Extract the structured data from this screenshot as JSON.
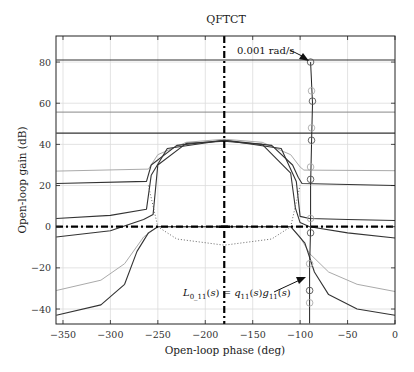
{
  "chart_data": {
    "type": "line",
    "title": "QFTCT",
    "xlabel": "Open-loop phase (deg)",
    "ylabel": "Open-loop gain (dB)",
    "xlim": [
      -357,
      0
    ],
    "ylim": [
      -47,
      93
    ],
    "xticks": [
      -350,
      -300,
      -250,
      -200,
      -150,
      -100,
      -50,
      0
    ],
    "yticks": [
      -40,
      -20,
      0,
      20,
      40,
      60,
      80
    ],
    "grid": true,
    "legend": null,
    "reference_lines": {
      "vertical_phase_deg": -180,
      "horizontal_gain_db": 0,
      "style": "dash-dot, thick, black"
    },
    "annotations": [
      {
        "text": "0.001 rad/s",
        "points_to": [
          -89,
          80
        ]
      },
      {
        "text": "L_{0_11}(s) = q_{11}(s)g_{11}(s)",
        "points_to": [
          -95,
          -30
        ]
      }
    ],
    "series": [
      {
        "name": "Bound 80 dB",
        "style": "dark",
        "points": [
          [
            -357,
            81
          ],
          [
            0,
            81
          ]
        ]
      },
      {
        "name": "Bound 56 dB",
        "style": "gray",
        "points": [
          [
            -357,
            55.7
          ],
          [
            0,
            55.7
          ]
        ]
      },
      {
        "name": "Bound 46 dB",
        "style": "dark",
        "points": [
          [
            -357,
            45.5
          ],
          [
            0,
            45.5
          ]
        ]
      },
      {
        "name": "Bound A",
        "style": "light",
        "points": [
          [
            -357,
            27
          ],
          [
            -260,
            28
          ],
          [
            -250,
            35
          ],
          [
            -220,
            41
          ],
          [
            -180,
            42.5
          ],
          [
            -140,
            41
          ],
          [
            -110,
            35
          ],
          [
            -100,
            29
          ],
          [
            -96,
            27.5
          ],
          [
            0,
            27.2
          ]
        ]
      },
      {
        "name": "Bound B",
        "style": "dark",
        "points": [
          [
            -357,
            21
          ],
          [
            -262,
            22
          ],
          [
            -257,
            30
          ],
          [
            -230,
            39.5
          ],
          [
            -180,
            42
          ],
          [
            -130,
            39.5
          ],
          [
            -108,
            30
          ],
          [
            -102,
            24
          ],
          [
            -98,
            21
          ],
          [
            0,
            20
          ]
        ]
      },
      {
        "name": "Bound C",
        "style": "dark",
        "points": [
          [
            -357,
            4
          ],
          [
            -300,
            5.5
          ],
          [
            -262,
            8.5
          ],
          [
            -257,
            25
          ],
          [
            -240,
            38
          ],
          [
            -180,
            42
          ],
          [
            -120,
            38
          ],
          [
            -104,
            22
          ],
          [
            -100,
            5
          ],
          [
            -90,
            4
          ],
          [
            -50,
            3.5
          ],
          [
            0,
            3
          ]
        ]
      },
      {
        "name": "Bound D",
        "style": "dark",
        "points": [
          [
            -357,
            -5
          ],
          [
            -300,
            -2
          ],
          [
            -265,
            3.5
          ],
          [
            -255,
            6
          ],
          [
            -250,
            30
          ],
          [
            -220,
            40.5
          ],
          [
            -180,
            41.5
          ],
          [
            -140,
            40
          ],
          [
            -110,
            26
          ],
          [
            -105,
            9
          ],
          [
            -100,
            2
          ],
          [
            -90,
            0
          ],
          [
            -50,
            -3
          ],
          [
            0,
            -5.5
          ]
        ]
      },
      {
        "name": "Bound E (light)",
        "style": "light",
        "points": [
          [
            -357,
            -31
          ],
          [
            -310,
            -26
          ],
          [
            -285,
            -18
          ],
          [
            -265,
            -5
          ],
          [
            -250,
            0
          ],
          [
            -110,
            0
          ],
          [
            -100,
            -5
          ],
          [
            -90,
            -13
          ],
          [
            -70,
            -22
          ],
          [
            -40,
            -28
          ],
          [
            0,
            -31.5
          ]
        ]
      },
      {
        "name": "Bound F",
        "style": "dark",
        "points": [
          [
            -357,
            -43
          ],
          [
            -310,
            -38
          ],
          [
            -285,
            -28
          ],
          [
            -272,
            -12
          ],
          [
            -260,
            -3
          ],
          [
            -250,
            0
          ],
          [
            -110,
            0
          ],
          [
            -95,
            -8
          ],
          [
            -85,
            -22
          ],
          [
            -70,
            -33
          ],
          [
            -40,
            -40
          ],
          [
            0,
            -43
          ]
        ]
      },
      {
        "name": "Dotted U-contour",
        "style": "dotted",
        "points": [
          [
            -260,
            20
          ],
          [
            -250,
            0
          ],
          [
            -230,
            -6
          ],
          [
            -180,
            -9
          ],
          [
            -130,
            -6
          ],
          [
            -110,
            0
          ],
          [
            -100,
            20
          ]
        ]
      },
      {
        "name": "L_0_11 nominal loop",
        "style": "dark-thin",
        "points": [
          [
            -89,
            80
          ],
          [
            -87,
            60
          ],
          [
            -88,
            40
          ],
          [
            -89,
            20
          ],
          [
            -89,
            0
          ],
          [
            -90,
            -20
          ],
          [
            -90,
            -47
          ]
        ]
      }
    ],
    "loop_markers_deg_db": [
      [
        -89,
        80
      ],
      [
        -88,
        66
      ],
      [
        -87,
        61
      ],
      [
        -88,
        48
      ],
      [
        -88,
        42
      ],
      [
        -89,
        29
      ],
      [
        -89,
        23
      ],
      [
        -89,
        4
      ],
      [
        -89,
        -3
      ],
      [
        -90,
        -18
      ],
      [
        -90,
        -31
      ],
      [
        -90,
        -37
      ]
    ]
  }
}
